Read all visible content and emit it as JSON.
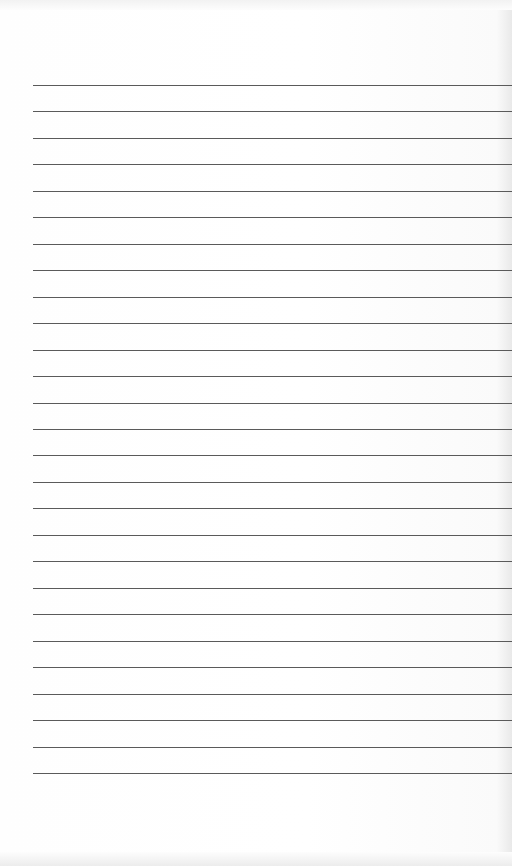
{
  "page": {
    "type": "lined-paper",
    "background_color": "#fdfdfd",
    "line_color": "#5a5a5a",
    "line_count": 27,
    "first_line_y": 85,
    "line_spacing": 26.46,
    "left_margin": 33
  }
}
